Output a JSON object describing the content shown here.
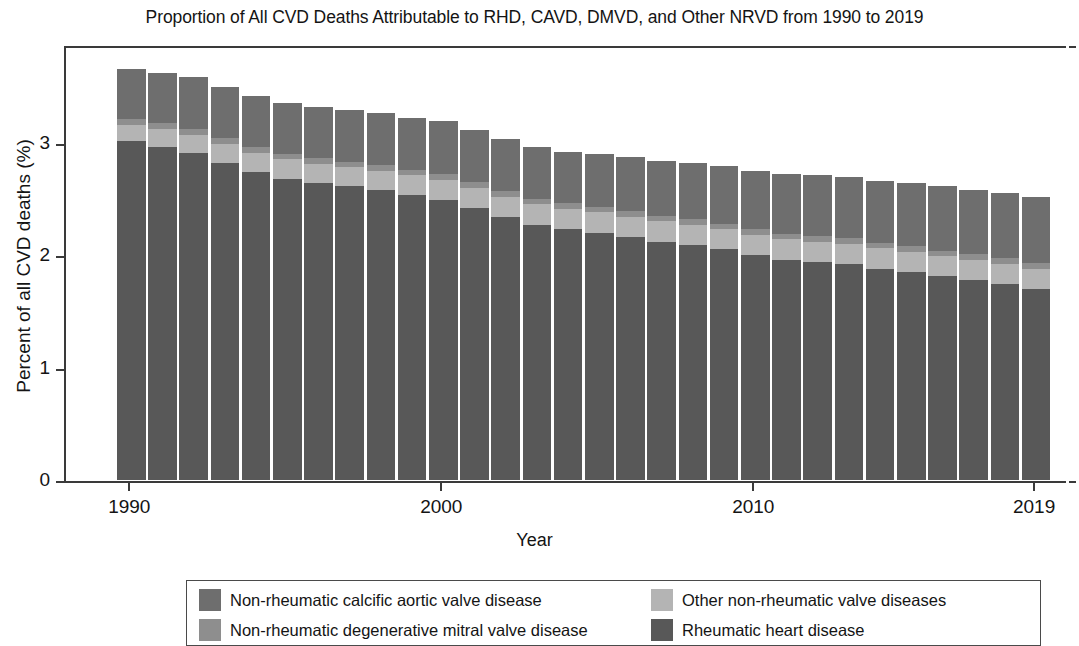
{
  "chart_title": "Proportion of All CVD Deaths Attributable to RHD, CAVD, DMVD, and Other NRVD from 1990 to 2019",
  "axes": {
    "x_title": "Year",
    "y_title": "Percent of all CVD deaths (%)",
    "x_tick_labels": [
      "1990",
      "2000",
      "2010",
      "2019"
    ],
    "y_tick_labels": [
      "0",
      "1",
      "2",
      "3"
    ]
  },
  "legend": {
    "items": [
      {
        "label": "Non-rheumatic calcific aortic valve disease",
        "color": "#6e6e6e",
        "key": "cavd"
      },
      {
        "label": "Other non-rheumatic valve diseases",
        "color": "#b4b4b4",
        "key": "other_nrvd"
      },
      {
        "label": "Non-rheumatic degenerative mitral valve disease",
        "color": "#8e8e8e",
        "key": "dmvd"
      },
      {
        "label": "Rheumatic heart disease",
        "color": "#585858",
        "key": "rhd"
      }
    ]
  },
  "colors": {
    "cavd": "#6e6e6e",
    "dmvd": "#8e8e8e",
    "other_nrvd": "#b4b4b4",
    "rhd": "#585858",
    "axis": "#3a3a3a",
    "text": "#141414",
    "background": "#ffffff"
  },
  "chart_data": {
    "type": "bar",
    "title": "Proportion of All CVD Deaths Attributable to RHD, CAVD, DMVD, and Other NRVD from 1990 to 2019",
    "xlabel": "Year",
    "ylabel": "Percent of all CVD deaths (%)",
    "stacked": true,
    "grid": false,
    "legend_position": "bottom",
    "ylim": [
      0,
      3.8
    ],
    "yticks": [
      0,
      1,
      2,
      3
    ],
    "xticks": [
      1990,
      2000,
      2010,
      2019
    ],
    "categories": [
      1990,
      1991,
      1992,
      1993,
      1994,
      1995,
      1996,
      1997,
      1998,
      1999,
      2000,
      2001,
      2002,
      2003,
      2004,
      2005,
      2006,
      2007,
      2008,
      2009,
      2010,
      2011,
      2012,
      2013,
      2014,
      2015,
      2016,
      2017,
      2018,
      2019
    ],
    "stack_order_bottom_to_top": [
      "rhd",
      "other_nrvd",
      "dmvd",
      "cavd"
    ],
    "series": [
      {
        "name": "Rheumatic heart disease",
        "key": "rhd",
        "color": "#585858",
        "values": [
          3.01,
          2.96,
          2.91,
          2.82,
          2.74,
          2.68,
          2.64,
          2.61,
          2.58,
          2.53,
          2.49,
          2.42,
          2.34,
          2.27,
          2.23,
          2.2,
          2.16,
          2.12,
          2.09,
          2.05,
          2.0,
          1.96,
          1.94,
          1.92,
          1.88,
          1.85,
          1.81,
          1.78,
          1.74,
          1.7
        ]
      },
      {
        "name": "Other non-rheumatic valve diseases",
        "key": "other_nrvd",
        "color": "#b4b4b4",
        "values": [
          0.15,
          0.16,
          0.16,
          0.17,
          0.17,
          0.17,
          0.17,
          0.17,
          0.17,
          0.18,
          0.18,
          0.18,
          0.18,
          0.18,
          0.18,
          0.18,
          0.18,
          0.18,
          0.18,
          0.18,
          0.18,
          0.18,
          0.18,
          0.18,
          0.18,
          0.18,
          0.18,
          0.18,
          0.18,
          0.18
        ]
      },
      {
        "name": "Non-rheumatic degenerative mitral valve disease",
        "key": "dmvd",
        "color": "#8e8e8e",
        "values": [
          0.05,
          0.05,
          0.05,
          0.05,
          0.05,
          0.05,
          0.05,
          0.05,
          0.05,
          0.05,
          0.05,
          0.05,
          0.05,
          0.05,
          0.05,
          0.05,
          0.05,
          0.05,
          0.05,
          0.05,
          0.05,
          0.05,
          0.05,
          0.05,
          0.05,
          0.05,
          0.05,
          0.05,
          0.05,
          0.05
        ]
      },
      {
        "name": "Non-rheumatic calcific aortic valve disease",
        "key": "cavd",
        "color": "#6e6e6e",
        "values": [
          0.44,
          0.45,
          0.46,
          0.45,
          0.45,
          0.45,
          0.46,
          0.46,
          0.46,
          0.46,
          0.47,
          0.46,
          0.46,
          0.46,
          0.46,
          0.47,
          0.48,
          0.49,
          0.5,
          0.51,
          0.52,
          0.53,
          0.54,
          0.54,
          0.55,
          0.56,
          0.57,
          0.57,
          0.58,
          0.59
        ]
      }
    ],
    "totals": [
      3.65,
      3.62,
      3.58,
      3.49,
      3.41,
      3.35,
      3.32,
      3.29,
      3.26,
      3.22,
      3.19,
      3.11,
      3.03,
      2.96,
      2.92,
      2.9,
      2.87,
      2.84,
      2.82,
      2.79,
      2.75,
      2.72,
      2.71,
      2.69,
      2.66,
      2.64,
      2.61,
      2.58,
      2.55,
      2.52
    ]
  }
}
